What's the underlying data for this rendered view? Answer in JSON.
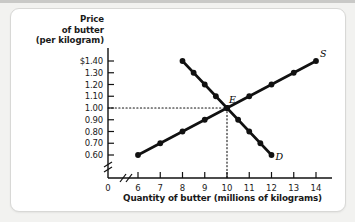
{
  "figure": {
    "background_color": "#f2f2f0",
    "panel_color": "#ffffff",
    "ink_color": "#111111"
  },
  "axes": {
    "y_title_line1": "Price",
    "y_title_line2": "of butter",
    "y_title_line3": "(per kilogram)",
    "x_title": "Quantity of butter (millions of kilograms)",
    "origin_label": "0",
    "y_ticks": [
      "$1.40",
      "1.30",
      "1.20",
      "1.10",
      "1.00",
      "0.90",
      "0.80",
      "0.70",
      "0.60"
    ],
    "x_ticks": [
      "6",
      "7",
      "8",
      "9",
      "10",
      "11",
      "12",
      "13",
      "14"
    ],
    "y_break": true,
    "x_break": true
  },
  "annotations": {
    "supply_label": "S",
    "demand_label": "D",
    "equilibrium_label": "E"
  },
  "chart_data": {
    "type": "line",
    "title": "",
    "xlabel": "Quantity of butter (millions of kilograms)",
    "ylabel": "Price of butter (per kilogram)",
    "xlim": [
      6,
      14
    ],
    "ylim": [
      0.6,
      1.4
    ],
    "grid": false,
    "legend_position": "inline-curve-ends",
    "equilibrium": {
      "label": "E",
      "quantity": 10,
      "price": 1.0
    },
    "guide_lines": {
      "horizontal_price": 1.0,
      "vertical_quantity": 10,
      "style": "dotted"
    },
    "series": [
      {
        "name": "S",
        "description": "Supply curve",
        "x": [
          6,
          7,
          8,
          9,
          10,
          11,
          12,
          13,
          14
        ],
        "y": [
          0.6,
          0.7,
          0.8,
          0.9,
          1.0,
          1.1,
          1.2,
          1.3,
          1.4
        ]
      },
      {
        "name": "D",
        "description": "Demand curve",
        "x": [
          8,
          8.5,
          9,
          9.5,
          10,
          10.5,
          11,
          11.5,
          12
        ],
        "y": [
          1.4,
          1.3,
          1.2,
          1.1,
          1.0,
          0.9,
          0.8,
          0.7,
          0.6
        ]
      }
    ]
  }
}
